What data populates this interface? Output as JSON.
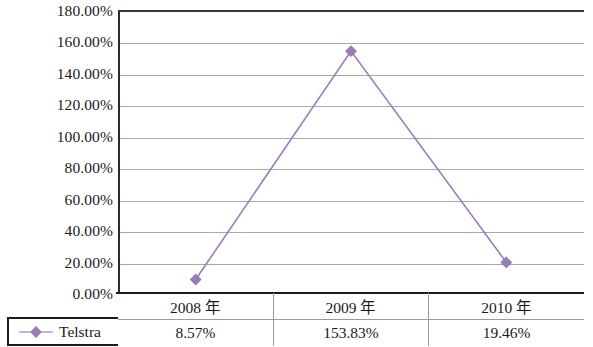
{
  "chart_data": {
    "type": "line",
    "title": "",
    "xlabel": "",
    "ylabel": "",
    "categories": [
      "2008 年",
      "2009 年",
      "2010 年"
    ],
    "series": [
      {
        "name": "Telstra",
        "values": [
          8.57,
          153.83,
          19.46
        ],
        "value_labels": [
          "8.57%",
          "153.83%",
          "19.46%"
        ],
        "color": "#9b7cb8",
        "marker": "diamond"
      }
    ],
    "ylim": [
      0,
      180
    ],
    "ytick_step": 20,
    "ytick_labels": [
      "180.00%",
      "160.00%",
      "140.00%",
      "120.00%",
      "100.00%",
      "80.00%",
      "60.00%",
      "40.00%",
      "20.00%",
      "0.00%"
    ],
    "ytick_values": [
      180,
      160,
      140,
      120,
      100,
      80,
      60,
      40,
      20,
      0
    ],
    "grid": true,
    "legend_position": "bottom-left"
  },
  "legend": {
    "series_label": "Telstra",
    "marker_icon": "diamond-marker-icon",
    "color": "#9b7cb8"
  },
  "table": {
    "header": [
      "2008 年",
      "2009 年",
      "2010 年"
    ],
    "rows": [
      [
        "8.57%",
        "153.83%",
        "19.46%"
      ]
    ]
  },
  "colors": {
    "series": "#9b7cb8",
    "grid": "#a9a9ad",
    "axis": "#1c1c1c",
    "text": "#1a1a1a"
  }
}
